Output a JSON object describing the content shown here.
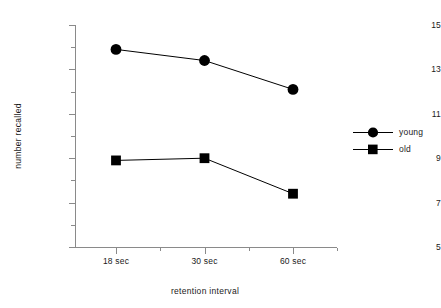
{
  "chart_data": {
    "type": "line",
    "title": "",
    "xlabel": "retention  interval",
    "ylabel": "number recalled",
    "categories": [
      "18 sec",
      "30 sec",
      "60 sec"
    ],
    "ylim": [
      5,
      15
    ],
    "y_major_ticks": [
      5,
      7,
      9,
      11,
      13,
      15
    ],
    "y_major_tick_labels": [
      "5",
      "7",
      "9",
      "11",
      "13",
      "15"
    ],
    "y_minor_ticks": [
      6,
      8,
      10,
      12,
      14
    ],
    "grid": false,
    "legend_position": "right",
    "series": [
      {
        "name": "young",
        "marker": "circle",
        "color": "#000000",
        "values": [
          13.9,
          13.4,
          12.1
        ]
      },
      {
        "name": "old",
        "marker": "square",
        "color": "#000000",
        "values": [
          8.9,
          9.0,
          7.4
        ]
      }
    ]
  },
  "axes": {
    "y_title": "number recalled",
    "x_title": "retention  interval",
    "y_labels": [
      "15",
      "13",
      "11",
      "9",
      "7",
      "5"
    ],
    "x_labels": [
      "18 sec",
      "30 sec",
      "60 sec"
    ]
  },
  "legend": {
    "items": [
      {
        "label": "young",
        "marker": "circle-marker"
      },
      {
        "label": "old",
        "marker": "square-marker"
      }
    ]
  }
}
